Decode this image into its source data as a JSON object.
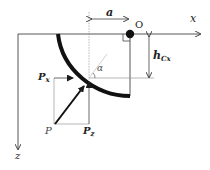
{
  "diagram": {
    "axes": {
      "x_label": "x",
      "z_label": "z",
      "origin_label": "O"
    },
    "dimensions": {
      "horizontal_label": "a",
      "vertical_label_main": "h",
      "vertical_label_sub": "Cx"
    },
    "angle_label": "α",
    "forces": {
      "resultant": "P",
      "horizontal_main": "P",
      "horizontal_sub": "x",
      "vertical_main": "P",
      "vertical_sub": "z"
    },
    "colors": {
      "ink": "#1a1a1a",
      "thin": "#555555",
      "guide": "#9a9a9a"
    }
  }
}
